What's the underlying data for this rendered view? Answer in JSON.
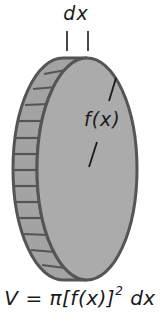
{
  "labels": {
    "width_label": "dx",
    "radius_label": "f(x)"
  },
  "formula": {
    "lhs": "V",
    "eq": "=",
    "pi": "π",
    "open": "[f(x)]",
    "exponent": "2",
    "tail": "dx",
    "full_text": "V = π[f(x)]² dx"
  },
  "colors": {
    "disk_fill": "#a9a9a9",
    "disk_stroke": "#555555",
    "text": "#1a1a1a",
    "background": "#ffffff"
  },
  "geometry": {
    "front_face": {
      "cx": 87,
      "cy": 169,
      "rx": 50,
      "ry": 111
    },
    "back_offset_x": -24,
    "rim_stripe_count": 13
  }
}
